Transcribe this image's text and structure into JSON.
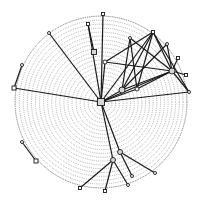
{
  "diagram": {
    "type": "network-on-sphere",
    "background": "#ffffff",
    "ink": "#1a1a1a",
    "grid_color": "#6e6e6e",
    "sphere": {
      "cx": 101,
      "cy": 102,
      "r": 86,
      "rings": 22,
      "ring_spacing": 3.9
    },
    "nodes": [
      {
        "id": "center",
        "x": 101,
        "y": 102,
        "shape": "square",
        "size": 7
      },
      {
        "id": "n-top1",
        "x": 88,
        "y": 24,
        "shape": "square",
        "size": 3
      },
      {
        "id": "n-top2",
        "x": 103,
        "y": 14,
        "shape": "square",
        "size": 3
      },
      {
        "id": "n-top3",
        "x": 49,
        "y": 33,
        "shape": "circle",
        "size": 3
      },
      {
        "id": "n-top4",
        "x": 130,
        "y": 38,
        "shape": "circle",
        "size": 3
      },
      {
        "id": "n-peak",
        "x": 153,
        "y": 32,
        "shape": "square",
        "size": 3
      },
      {
        "id": "n-r1",
        "x": 167,
        "y": 44,
        "shape": "circle",
        "size": 3
      },
      {
        "id": "n-r2",
        "x": 178,
        "y": 58,
        "shape": "square",
        "size": 3
      },
      {
        "id": "n-r3",
        "x": 186,
        "y": 75,
        "shape": "square",
        "size": 3
      },
      {
        "id": "n-r4",
        "x": 189,
        "y": 92,
        "shape": "circle",
        "size": 3
      },
      {
        "id": "n-hub",
        "x": 172,
        "y": 71,
        "shape": "circle",
        "size": 6
      },
      {
        "id": "n-mid1",
        "x": 94,
        "y": 52,
        "shape": "square",
        "size": 5
      },
      {
        "id": "n-mid2",
        "x": 122,
        "y": 90,
        "shape": "circle",
        "size": 6
      },
      {
        "id": "n-mid3",
        "x": 137,
        "y": 89,
        "shape": "circle",
        "size": 4
      },
      {
        "id": "n-mid4",
        "x": 105,
        "y": 62,
        "shape": "circle",
        "size": 4
      },
      {
        "id": "n-left1",
        "x": 14,
        "y": 88,
        "shape": "square",
        "size": 4
      },
      {
        "id": "n-left2",
        "x": 22,
        "y": 65,
        "shape": "circle",
        "size": 3
      },
      {
        "id": "n-ll1",
        "x": 22,
        "y": 142,
        "shape": "circle",
        "size": 3
      },
      {
        "id": "n-ll2",
        "x": 36,
        "y": 161,
        "shape": "square",
        "size": 4
      },
      {
        "id": "n-bot-hub",
        "x": 113,
        "y": 160,
        "shape": "circle",
        "size": 5
      },
      {
        "id": "n-bot-hub2",
        "x": 120,
        "y": 152,
        "shape": "circle",
        "size": 5
      },
      {
        "id": "n-b1",
        "x": 80,
        "y": 188,
        "shape": "square",
        "size": 3
      },
      {
        "id": "n-b2",
        "x": 105,
        "y": 191,
        "shape": "square",
        "size": 3
      },
      {
        "id": "n-b3",
        "x": 128,
        "y": 185,
        "shape": "circle",
        "size": 3
      },
      {
        "id": "n-b4",
        "x": 155,
        "y": 173,
        "shape": "circle",
        "size": 3
      },
      {
        "id": "n-b5",
        "x": 132,
        "y": 176,
        "shape": "circle",
        "size": 3
      }
    ],
    "edges": [
      [
        "center",
        "n-top1"
      ],
      [
        "center",
        "n-top2"
      ],
      [
        "center",
        "n-top3"
      ],
      [
        "center",
        "n-left1"
      ],
      [
        "center",
        "n-peak"
      ],
      [
        "center",
        "n-hub"
      ],
      [
        "center",
        "n-mid2"
      ],
      [
        "center",
        "n-mid3"
      ],
      [
        "center",
        "n-bot-hub"
      ],
      [
        "center",
        "n-bot-hub2"
      ],
      [
        "center",
        "n-r4"
      ],
      [
        "center",
        "n-mid4"
      ],
      [
        "n-left1",
        "n-left2"
      ],
      [
        "n-ll1",
        "n-ll2"
      ],
      [
        "n-peak",
        "n-mid2"
      ],
      [
        "n-peak",
        "n-mid3"
      ],
      [
        "n-peak",
        "n-hub"
      ],
      [
        "n-peak",
        "n-mid4"
      ],
      [
        "n-peak",
        "n-r4"
      ],
      [
        "n-top4",
        "n-mid2"
      ],
      [
        "n-top4",
        "n-hub"
      ],
      [
        "n-r1",
        "n-hub"
      ],
      [
        "n-r2",
        "n-hub"
      ],
      [
        "n-r3",
        "n-hub"
      ],
      [
        "n-r4",
        "n-hub"
      ],
      [
        "n-mid2",
        "n-hub"
      ],
      [
        "n-mid3",
        "n-hub"
      ],
      [
        "n-mid1",
        "n-top1"
      ],
      [
        "n-mid4",
        "n-hub"
      ],
      [
        "n-top4",
        "n-mid3"
      ],
      [
        "n-r1",
        "n-mid2"
      ],
      [
        "n-bot-hub",
        "n-b1"
      ],
      [
        "n-bot-hub",
        "n-b2"
      ],
      [
        "n-bot-hub",
        "n-b3"
      ],
      [
        "n-bot-hub2",
        "n-b4"
      ],
      [
        "n-bot-hub2",
        "n-b5"
      ]
    ]
  }
}
